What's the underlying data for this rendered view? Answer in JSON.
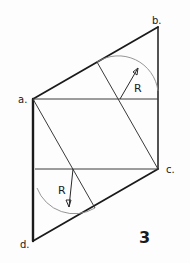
{
  "figure": {
    "number_label": "3",
    "colors": {
      "ink": "#1a1a1a",
      "thin_ink": "#3a3a3a",
      "arc": "#8a8a8a",
      "background": "#fdfdfd"
    }
  },
  "vertices": [
    {
      "id": "a",
      "label": "a.",
      "x": 33,
      "y": 99
    },
    {
      "id": "b",
      "label": "b.",
      "x": 158,
      "y": 27
    },
    {
      "id": "c",
      "label": "c.",
      "x": 158,
      "y": 169
    },
    {
      "id": "d",
      "label": "d.",
      "x": 33,
      "y": 241
    }
  ],
  "annotations": {
    "upper_radius_label": "R",
    "lower_radius_label": "R"
  }
}
